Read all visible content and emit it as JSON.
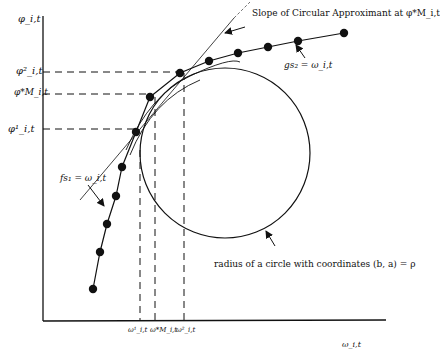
{
  "diagram": {
    "axes": {
      "y_label": "φ_i,t",
      "x_label": "ω_i,t"
    },
    "y_ticks": [
      {
        "label": "φ²_i,t",
        "y": 72
      },
      {
        "label": "φ*M_i,t",
        "y": 94
      },
      {
        "label": "φ¹_i,t",
        "y": 129
      }
    ],
    "x_ticks": [
      {
        "label": "ω¹_i,t",
        "x": 140
      },
      {
        "label": "ω*M_i,t",
        "x": 155
      },
      {
        "label": "ω²_i,t",
        "x": 184
      }
    ],
    "annotations": {
      "slope": "Slope of Circular Approximant at φ*M_i,t",
      "g_curve": "gs₂ = ω_i,t",
      "f_curve": "fs₁ = ω_i,t",
      "radius": "radius of a circle with coordinates (b, a) = ρ"
    },
    "upper_curve_points": [
      [
        150,
        97
      ],
      [
        180,
        73
      ],
      [
        209,
        61
      ],
      [
        238,
        53
      ],
      [
        268,
        47
      ],
      [
        298,
        41
      ],
      [
        344,
        33
      ]
    ],
    "lower_curve_points": [
      [
        93,
        289
      ],
      [
        100,
        252
      ],
      [
        107,
        224
      ],
      [
        116,
        196
      ],
      [
        122,
        167
      ],
      [
        136,
        132
      ],
      [
        150,
        97
      ]
    ],
    "circle": {
      "cx": 225,
      "cy": 153,
      "r": 85
    }
  }
}
